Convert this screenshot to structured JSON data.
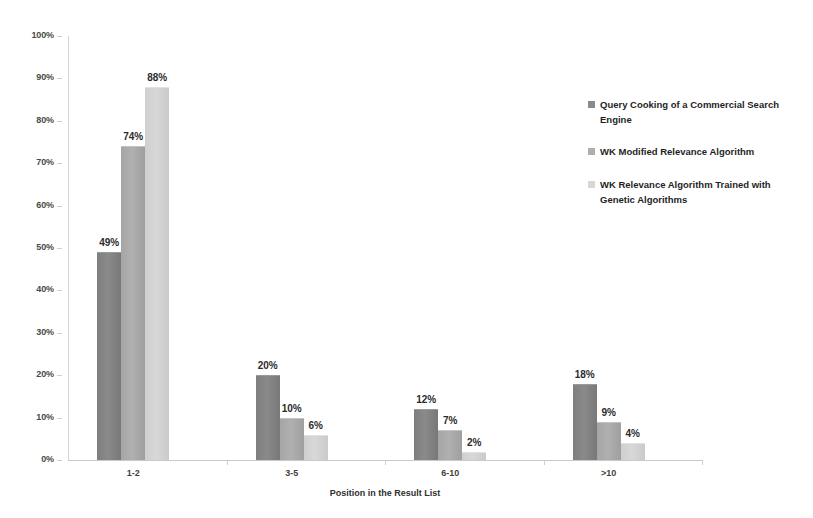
{
  "chart_data": {
    "type": "bar",
    "title": "",
    "xlabel": "Position in the Result List",
    "ylabel": "",
    "categories": [
      "1-2",
      "3-5",
      "6-10",
      ">10"
    ],
    "ylim": [
      0,
      100
    ],
    "ytick_labels": [
      "0%",
      "10%",
      "20%",
      "30%",
      "40%",
      "50%",
      "60%",
      "70%",
      "80%",
      "90%",
      "100%"
    ],
    "ytick_values": [
      0,
      10,
      20,
      30,
      40,
      50,
      60,
      70,
      80,
      90,
      100
    ],
    "grid": false,
    "legend_position": "right",
    "value_suffix": "%",
    "series": [
      {
        "name": "Query Cooking of a Commercial Search Engine",
        "color": "#8a8a8a",
        "values": [
          49,
          20,
          12,
          18
        ],
        "labels": [
          "49%",
          "20%",
          "12%",
          "18%"
        ]
      },
      {
        "name": "WK Modified Relevance Algorithm",
        "color": "#aeaeae",
        "values": [
          74,
          10,
          7,
          9
        ],
        "labels": [
          "74%",
          "10%",
          "7%",
          "9%"
        ]
      },
      {
        "name": "WK Relevance Algorithm Trained with Genetic Algorithms",
        "color": "#d6d6d6",
        "values": [
          88,
          6,
          2,
          4
        ],
        "labels": [
          "88%",
          "6%",
          "2%",
          "4%"
        ]
      }
    ]
  }
}
